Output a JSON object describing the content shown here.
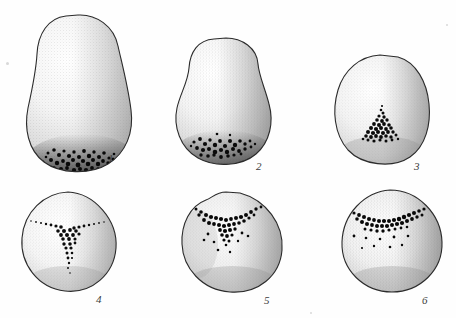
{
  "plate": {
    "kind": "scientific-stipple-illustration-plate",
    "background_color": "#fefefe",
    "ink_color": "#1a1a1a",
    "outline_color": "#2b2b2b",
    "shade_color": "#9a9a9a",
    "width": 456,
    "height": 318,
    "figure_count": 6,
    "rows": 2,
    "columns": 3
  },
  "figures": [
    {
      "label": "1",
      "shape": "elongated pear / ovoid",
      "label_x": 108,
      "label_y": 152,
      "box": {
        "x": 18,
        "y": 12,
        "w": 120,
        "h": 155
      },
      "pigment": {
        "pattern": "basal band",
        "position": "bottom",
        "density": "very dense"
      },
      "shading": {
        "highlight_side": "left",
        "shadow_side": "right"
      }
    },
    {
      "label": "2",
      "shape": "broad pear / ovoid",
      "label_x": 258,
      "label_y": 164,
      "box": {
        "x": 170,
        "y": 36,
        "w": 100,
        "h": 130
      },
      "pigment": {
        "pattern": "basal band",
        "position": "lower",
        "density": "dense"
      },
      "shading": {
        "highlight_side": "left",
        "shadow_side": "right"
      }
    },
    {
      "label": "3",
      "shape": "rounded oval",
      "label_x": 412,
      "label_y": 164,
      "box": {
        "x": 330,
        "y": 52,
        "w": 100,
        "h": 115
      },
      "pigment": {
        "pattern": "triangular cluster",
        "position": "center-low",
        "density": "dense"
      },
      "shading": {
        "highlight_side": "center",
        "shadow_side": "right"
      }
    },
    {
      "label": "4",
      "shape": "circular",
      "label_x": 96,
      "label_y": 301,
      "box": {
        "x": 18,
        "y": 190,
        "w": 98,
        "h": 105
      },
      "pigment": {
        "pattern": "three-rayed Y / tri-radiate",
        "position": "center",
        "density": "moderate"
      },
      "shading": {
        "highlight_side": "center",
        "shadow_side": "right"
      }
    },
    {
      "label": "5",
      "shape": "circular",
      "label_x": 266,
      "label_y": 301,
      "box": {
        "x": 178,
        "y": 190,
        "w": 105,
        "h": 108
      },
      "pigment": {
        "pattern": "chevron / V-shaped arc with scattered dots",
        "position": "upper",
        "density": "dense"
      },
      "shading": {
        "highlight_side": "center",
        "shadow_side": "right"
      }
    },
    {
      "label": "6",
      "shape": "circular",
      "label_x": 422,
      "label_y": 301,
      "box": {
        "x": 338,
        "y": 188,
        "w": 105,
        "h": 110
      },
      "pigment": {
        "pattern": "horizontal arc band with scattered dots",
        "position": "upper",
        "density": "dense"
      },
      "shading": {
        "highlight_side": "center",
        "shadow_side": "right"
      }
    }
  ]
}
